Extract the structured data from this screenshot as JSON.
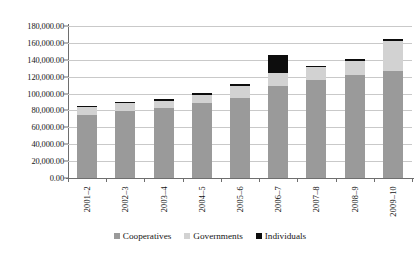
{
  "chart_data": {
    "type": "bar",
    "subtype": "stacked-column",
    "title": "",
    "xlabel": "",
    "ylabel": "",
    "categories": [
      "2001–2",
      "2002–3",
      "2003–4",
      "2004–5",
      "2005–6",
      "2006–7",
      "2007–8",
      "2008–9",
      "2009–10"
    ],
    "series": [
      {
        "name": "Cooperatives",
        "color": "#9a9a9a",
        "values": [
          75000,
          79500,
          83500,
          88500,
          94500,
          109500,
          115500,
          121500,
          126500
        ]
      },
      {
        "name": "Governments",
        "color": "#d2d2d2",
        "values": [
          9000,
          9500,
          8000,
          10000,
          14500,
          14500,
          15500,
          17000,
          35500
        ]
      },
      {
        "name": "Individuals",
        "color": "#0d0d0d",
        "values": [
          1500,
          1500,
          1500,
          2000,
          2000,
          21500,
          2000,
          2500,
          3000
        ]
      }
    ],
    "totals": [
      85500,
      90500,
      93000,
      100500,
      111000,
      145500,
      133000,
      141000,
      165000
    ],
    "ylim": [
      0,
      180000
    ],
    "ytick_step": 20000,
    "ytick_labels": [
      "0.00",
      "20,000.00",
      "40,000.00",
      "60,000.00",
      "80,000.00",
      "100,000.00",
      "120,000.00",
      "140,000.00",
      "160,000.00",
      "180,000.00"
    ],
    "ytick_values": [
      0,
      20000,
      40000,
      60000,
      80000,
      100000,
      120000,
      140000,
      160000,
      180000
    ],
    "grid": true,
    "legend_position": "bottom",
    "legend": [
      "Cooperatives",
      "Governments",
      "Individuals"
    ]
  },
  "legend": {
    "items": [
      {
        "label": "Cooperatives",
        "color": "#9a9a9a"
      },
      {
        "label": "Governments",
        "color": "#d2d2d2"
      },
      {
        "label": "Individuals",
        "color": "#0d0d0d"
      }
    ]
  }
}
